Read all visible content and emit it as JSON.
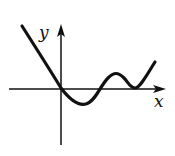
{
  "figure": {
    "type": "function-graph-sketch",
    "axes": {
      "x_label": "x",
      "y_label": "y",
      "color": "#111111"
    },
    "curve": {
      "color": "#111111",
      "description": "Decreasing from upper-left through origin to a local minimum below the x-axis, rising to a local maximum above the x-axis, dipping to a local minimum touching the x-axis, then increasing to the right"
    }
  }
}
